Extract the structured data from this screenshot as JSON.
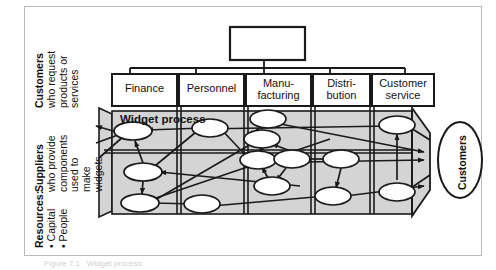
{
  "figure": {
    "caption": "Figure 7.1   Widget process",
    "top_box_label": "",
    "widget_process_label": "Widget process",
    "customers_oval_label": "Customers"
  },
  "side_labels": {
    "customers": {
      "title": "Customers",
      "lines": [
        "who request",
        "products or",
        "services"
      ]
    },
    "suppliers": {
      "title": "Suppliers",
      "lines": [
        "who provide",
        "components",
        "used to",
        "make",
        "widgets"
      ]
    },
    "resources": {
      "title": "Resources:",
      "lines": [
        "• Capital",
        "• People"
      ]
    }
  },
  "departments": [
    {
      "id": "finance",
      "lines": [
        "Finance"
      ]
    },
    {
      "id": "personnel",
      "lines": [
        "Personnel"
      ]
    },
    {
      "id": "manufacturing",
      "lines": [
        "Manu-",
        "facturing"
      ]
    },
    {
      "id": "distribution",
      "lines": [
        "Distri-",
        "bution"
      ]
    },
    {
      "id": "customer-service",
      "lines": [
        "Customer",
        "service"
      ]
    }
  ],
  "colors": {
    "band_fill": "#d4d4d4",
    "line": "#1a1a1a",
    "frame": "#b9b9b9",
    "oval_fill": "#ffffff",
    "page": "#ffffff"
  },
  "process_nodes": [
    {
      "id": "fin-1",
      "dept": "finance",
      "cx": 133,
      "cy": 131
    },
    {
      "id": "fin-2",
      "dept": "finance",
      "cx": 143,
      "cy": 172
    },
    {
      "id": "fin-3",
      "dept": "finance",
      "cx": 140,
      "cy": 203
    },
    {
      "id": "per-1",
      "dept": "personnel",
      "cx": 210,
      "cy": 128
    },
    {
      "id": "per-2",
      "dept": "personnel",
      "cx": 202,
      "cy": 204
    },
    {
      "id": "man-1",
      "dept": "manufacturing",
      "cx": 268,
      "cy": 119
    },
    {
      "id": "man-2",
      "dept": "manufacturing",
      "cx": 262,
      "cy": 139
    },
    {
      "id": "man-3",
      "dept": "manufacturing",
      "cx": 258,
      "cy": 160
    },
    {
      "id": "man-4",
      "dept": "manufacturing",
      "cx": 290,
      "cy": 159
    },
    {
      "id": "man-5",
      "dept": "manufacturing",
      "cx": 272,
      "cy": 186
    },
    {
      "id": "dis-1",
      "dept": "distribution",
      "cx": 341,
      "cy": 159
    },
    {
      "id": "dis-2",
      "dept": "distribution",
      "cx": 333,
      "cy": 196
    },
    {
      "id": "cs-1",
      "dept": "customer-service",
      "cx": 397,
      "cy": 125
    },
    {
      "id": "cs-2",
      "dept": "customer-service",
      "cx": 397,
      "cy": 192
    }
  ]
}
